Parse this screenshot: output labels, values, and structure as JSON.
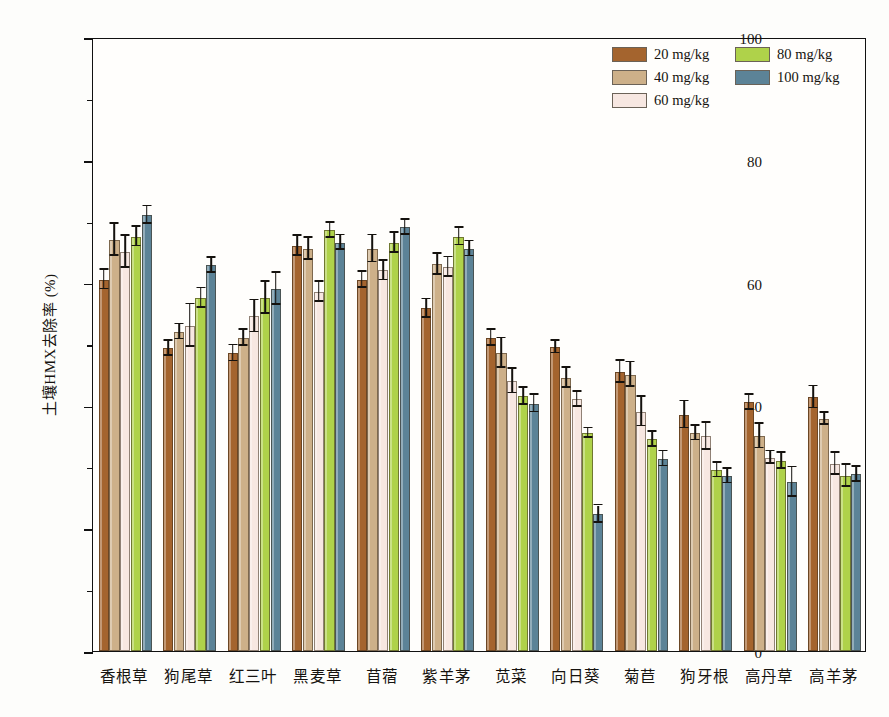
{
  "chart_data": {
    "type": "bar",
    "title": "",
    "xlabel": "",
    "ylabel": "土壤HMX去除率 (%)",
    "ylim": [
      0,
      100
    ],
    "yticks": [
      0,
      20,
      40,
      60,
      80,
      100
    ],
    "yminorticks": [
      10,
      30,
      50,
      70,
      90
    ],
    "grid": false,
    "legend_position": "top-right",
    "categories": [
      "香根草",
      "狗尾草",
      "红三叶",
      "黑麦草",
      "苜蓿",
      "紫羊茅",
      "苋菜",
      "向日葵",
      "菊苣",
      "狗牙根",
      "高丹草",
      "高羊茅"
    ],
    "series": [
      {
        "name": "20 mg/kg",
        "color": "#A4642E",
        "values": [
          60.5,
          49.3,
          48.5,
          66.0,
          60.5,
          55.8,
          51.0,
          49.5,
          45.5,
          38.5,
          40.5,
          41.3
        ],
        "errors": [
          1.6,
          1.2,
          1.3,
          1.6,
          1.3,
          1.5,
          1.3,
          1.0,
          1.8,
          2.2,
          1.2,
          1.8
        ]
      },
      {
        "name": "40 mg/kg",
        "color": "#CDB089",
        "values": [
          67.0,
          52.0,
          51.0,
          65.5,
          65.5,
          63.0,
          48.5,
          44.5,
          45.0,
          35.5,
          35.0,
          37.8
        ],
        "errors": [
          2.6,
          1.2,
          1.3,
          1.8,
          2.2,
          1.7,
          2.4,
          1.6,
          2.0,
          1.2,
          2.0,
          1.0
        ]
      },
      {
        "name": "60 mg/kg",
        "color": "#F7E7E1",
        "values": [
          65.0,
          53.0,
          54.5,
          58.5,
          62.0,
          62.5,
          44.0,
          41.0,
          39.0,
          35.0,
          31.5,
          30.5
        ],
        "errors": [
          2.6,
          3.5,
          2.6,
          1.6,
          1.6,
          1.6,
          2.0,
          1.2,
          2.4,
          2.2,
          1.0,
          1.8
        ]
      },
      {
        "name": "80 mg/kg",
        "color": "#AFD24A",
        "values": [
          67.5,
          57.5,
          57.5,
          68.5,
          66.5,
          67.5,
          41.5,
          35.5,
          34.5,
          29.5,
          31.0,
          28.5
        ],
        "errors": [
          1.6,
          1.6,
          2.6,
          1.2,
          1.6,
          1.4,
          1.4,
          0.8,
          1.2,
          1.2,
          1.3,
          1.8
        ]
      },
      {
        "name": "100 mg/kg",
        "color": "#5C8397",
        "values": [
          71.0,
          62.8,
          59.0,
          66.5,
          69.0,
          65.5,
          40.3,
          22.3,
          31.3,
          28.5,
          27.5,
          28.8
        ],
        "errors": [
          1.4,
          1.2,
          2.6,
          1.2,
          1.2,
          1.2,
          1.4,
          1.4,
          1.2,
          1.2,
          2.4,
          1.2
        ]
      }
    ]
  }
}
